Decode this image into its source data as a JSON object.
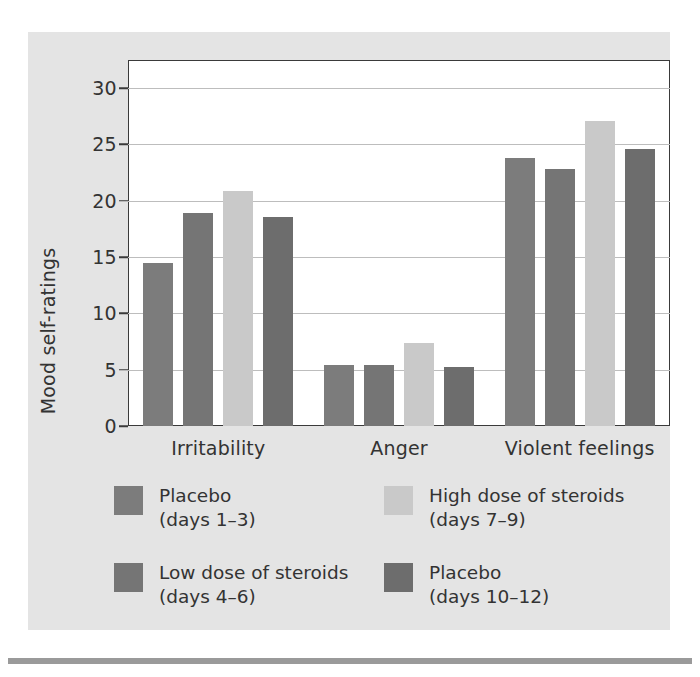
{
  "chart_data": {
    "type": "bar",
    "title": "",
    "xlabel": "",
    "ylabel": "Mood self-ratings",
    "categories": [
      "Irritability",
      "Anger",
      "Violent feelings"
    ],
    "ylim": [
      0,
      32.5
    ],
    "yticks": [
      0,
      5,
      10,
      15,
      20,
      25,
      30
    ],
    "ytick_labels": [
      "0",
      "5",
      "10",
      "15",
      "20",
      "25",
      "30"
    ],
    "grid": true,
    "legend_position": "below-plot",
    "series": [
      {
        "name": "Placebo",
        "sub": "(days 1–3)",
        "color": "#7c7c7c",
        "values": [
          14.5,
          5.4,
          23.8
        ]
      },
      {
        "name": "Low dose of steroids",
        "sub": "(days 4–6)",
        "color": "#757575",
        "values": [
          18.9,
          5.4,
          22.8
        ]
      },
      {
        "name": "High dose of steroids",
        "sub": "(days 7–9)",
        "color": "#c9c9c9",
        "values": [
          20.9,
          7.4,
          27.1
        ]
      },
      {
        "name": "Placebo",
        "sub": "(days 10–12)",
        "color": "#6d6d6d",
        "values": [
          18.6,
          5.2,
          24.6
        ]
      }
    ]
  }
}
